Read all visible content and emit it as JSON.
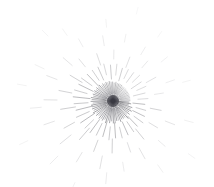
{
  "figure": {
    "type": "radial-streak-field",
    "width": 214,
    "height": 187,
    "background_color": "#ffffff",
    "stroke_color": "#3a3a42",
    "hub": {
      "x": 113,
      "y": 101
    }
  },
  "chart_data": {
    "type": "scatter",
    "xlabel": "",
    "ylabel": "",
    "xlim": [
      0,
      214
    ],
    "ylim": [
      0,
      187
    ],
    "grid": false,
    "legend": null,
    "center": [
      113,
      101
    ],
    "units": "pixels",
    "field_names": [
      "angle",
      "r0",
      "len",
      "w",
      "a"
    ],
    "streaks": [
      [
        4,
        6,
        10,
        0.6,
        0.75
      ],
      [
        9,
        5,
        13,
        0.6,
        0.8
      ],
      [
        14,
        7,
        9,
        0.5,
        0.7
      ],
      [
        19,
        6,
        14,
        0.6,
        0.78
      ],
      [
        24,
        8,
        11,
        0.5,
        0.62
      ],
      [
        29,
        5,
        16,
        0.6,
        0.8
      ],
      [
        34,
        7,
        12,
        0.55,
        0.7
      ],
      [
        39,
        6,
        15,
        0.6,
        0.75
      ],
      [
        44,
        9,
        10,
        0.5,
        0.6
      ],
      [
        49,
        6,
        17,
        0.6,
        0.8
      ],
      [
        54,
        8,
        12,
        0.55,
        0.68
      ],
      [
        59,
        5,
        15,
        0.6,
        0.76
      ],
      [
        64,
        7,
        13,
        0.55,
        0.7
      ],
      [
        69,
        6,
        16,
        0.6,
        0.74
      ],
      [
        74,
        9,
        11,
        0.5,
        0.6
      ],
      [
        79,
        6,
        14,
        0.6,
        0.72
      ],
      [
        84,
        7,
        15,
        0.55,
        0.7
      ],
      [
        89,
        5,
        17,
        0.6,
        0.78
      ],
      [
        94,
        8,
        12,
        0.55,
        0.66
      ],
      [
        99,
        6,
        16,
        0.6,
        0.76
      ],
      [
        104,
        7,
        13,
        0.55,
        0.7
      ],
      [
        109,
        5,
        18,
        0.6,
        0.8
      ],
      [
        114,
        8,
        12,
        0.55,
        0.66
      ],
      [
        119,
        6,
        16,
        0.6,
        0.75
      ],
      [
        124,
        7,
        14,
        0.55,
        0.7
      ],
      [
        129,
        5,
        17,
        0.6,
        0.78
      ],
      [
        134,
        8,
        12,
        0.55,
        0.65
      ],
      [
        139,
        6,
        16,
        0.6,
        0.76
      ],
      [
        144,
        7,
        13,
        0.55,
        0.7
      ],
      [
        149,
        5,
        18,
        0.6,
        0.8
      ],
      [
        154,
        8,
        13,
        0.55,
        0.68
      ],
      [
        159,
        6,
        16,
        0.6,
        0.75
      ],
      [
        164,
        7,
        14,
        0.55,
        0.7
      ],
      [
        169,
        5,
        17,
        0.6,
        0.78
      ],
      [
        174,
        8,
        12,
        0.55,
        0.65
      ],
      [
        179,
        6,
        16,
        0.6,
        0.76
      ],
      [
        184,
        7,
        14,
        0.55,
        0.7
      ],
      [
        189,
        5,
        17,
        0.6,
        0.77
      ],
      [
        194,
        8,
        12,
        0.55,
        0.64
      ],
      [
        199,
        6,
        15,
        0.6,
        0.73
      ],
      [
        204,
        7,
        13,
        0.55,
        0.68
      ],
      [
        209,
        5,
        16,
        0.6,
        0.75
      ],
      [
        214,
        8,
        12,
        0.55,
        0.63
      ],
      [
        219,
        6,
        15,
        0.6,
        0.72
      ],
      [
        224,
        7,
        13,
        0.55,
        0.66
      ],
      [
        229,
        5,
        16,
        0.6,
        0.74
      ],
      [
        234,
        8,
        11,
        0.5,
        0.6
      ],
      [
        239,
        6,
        14,
        0.55,
        0.7
      ],
      [
        244,
        7,
        12,
        0.5,
        0.64
      ],
      [
        249,
        5,
        15,
        0.55,
        0.7
      ],
      [
        254,
        8,
        11,
        0.5,
        0.58
      ],
      [
        259,
        6,
        14,
        0.55,
        0.66
      ],
      [
        264,
        7,
        12,
        0.5,
        0.6
      ],
      [
        269,
        5,
        14,
        0.55,
        0.66
      ],
      [
        274,
        8,
        10,
        0.5,
        0.55
      ],
      [
        279,
        6,
        13,
        0.55,
        0.62
      ],
      [
        284,
        7,
        11,
        0.5,
        0.56
      ],
      [
        289,
        5,
        13,
        0.55,
        0.62
      ],
      [
        294,
        8,
        10,
        0.5,
        0.52
      ],
      [
        299,
        6,
        12,
        0.5,
        0.58
      ],
      [
        304,
        7,
        10,
        0.5,
        0.52
      ],
      [
        309,
        5,
        12,
        0.5,
        0.58
      ],
      [
        314,
        8,
        9,
        0.45,
        0.5
      ],
      [
        319,
        6,
        11,
        0.5,
        0.55
      ],
      [
        324,
        7,
        10,
        0.45,
        0.5
      ],
      [
        329,
        5,
        12,
        0.5,
        0.56
      ],
      [
        334,
        8,
        9,
        0.45,
        0.48
      ],
      [
        339,
        6,
        11,
        0.5,
        0.54
      ],
      [
        344,
        7,
        10,
        0.45,
        0.5
      ],
      [
        349,
        5,
        12,
        0.5,
        0.56
      ],
      [
        354,
        8,
        9,
        0.45,
        0.5
      ],
      [
        359,
        6,
        11,
        0.5,
        0.55
      ],
      [
        6,
        20,
        12,
        0.55,
        0.6
      ],
      [
        16,
        24,
        10,
        0.5,
        0.5
      ],
      [
        26,
        22,
        13,
        0.55,
        0.58
      ],
      [
        36,
        26,
        11,
        0.5,
        0.5
      ],
      [
        46,
        21,
        14,
        0.55,
        0.6
      ],
      [
        56,
        25,
        12,
        0.5,
        0.52
      ],
      [
        66,
        23,
        14,
        0.55,
        0.58
      ],
      [
        76,
        27,
        11,
        0.5,
        0.48
      ],
      [
        86,
        22,
        15,
        0.55,
        0.6
      ],
      [
        96,
        26,
        13,
        0.5,
        0.52
      ],
      [
        106,
        21,
        16,
        0.55,
        0.62
      ],
      [
        116,
        25,
        13,
        0.5,
        0.54
      ],
      [
        126,
        23,
        16,
        0.55,
        0.62
      ],
      [
        136,
        27,
        12,
        0.5,
        0.5
      ],
      [
        146,
        22,
        17,
        0.55,
        0.64
      ],
      [
        156,
        26,
        14,
        0.5,
        0.54
      ],
      [
        166,
        21,
        17,
        0.55,
        0.64
      ],
      [
        176,
        25,
        14,
        0.5,
        0.55
      ],
      [
        186,
        23,
        17,
        0.55,
        0.63
      ],
      [
        196,
        27,
        13,
        0.5,
        0.5
      ],
      [
        206,
        22,
        16,
        0.55,
        0.6
      ],
      [
        216,
        26,
        13,
        0.5,
        0.5
      ],
      [
        226,
        21,
        16,
        0.55,
        0.6
      ],
      [
        236,
        25,
        12,
        0.5,
        0.48
      ],
      [
        246,
        23,
        14,
        0.5,
        0.52
      ],
      [
        256,
        27,
        11,
        0.45,
        0.44
      ],
      [
        266,
        22,
        14,
        0.5,
        0.52
      ],
      [
        276,
        26,
        11,
        0.45,
        0.42
      ],
      [
        286,
        21,
        13,
        0.5,
        0.48
      ],
      [
        296,
        25,
        10,
        0.45,
        0.4
      ],
      [
        306,
        23,
        12,
        0.45,
        0.44
      ],
      [
        316,
        27,
        10,
        0.45,
        0.38
      ],
      [
        326,
        22,
        12,
        0.45,
        0.44
      ],
      [
        336,
        26,
        10,
        0.45,
        0.38
      ],
      [
        346,
        21,
        12,
        0.45,
        0.44
      ],
      [
        356,
        25,
        10,
        0.45,
        0.4
      ],
      [
        11,
        38,
        11,
        0.5,
        0.45
      ],
      [
        31,
        42,
        10,
        0.45,
        0.38
      ],
      [
        51,
        36,
        13,
        0.5,
        0.46
      ],
      [
        71,
        44,
        10,
        0.45,
        0.36
      ],
      [
        91,
        38,
        14,
        0.5,
        0.48
      ],
      [
        111,
        42,
        12,
        0.5,
        0.44
      ],
      [
        131,
        36,
        15,
        0.5,
        0.5
      ],
      [
        151,
        44,
        12,
        0.5,
        0.44
      ],
      [
        171,
        38,
        15,
        0.5,
        0.5
      ],
      [
        191,
        42,
        13,
        0.5,
        0.45
      ],
      [
        211,
        36,
        14,
        0.5,
        0.46
      ],
      [
        231,
        44,
        10,
        0.45,
        0.34
      ],
      [
        251,
        38,
        12,
        0.45,
        0.38
      ],
      [
        271,
        42,
        9,
        0.4,
        0.3
      ],
      [
        291,
        36,
        11,
        0.45,
        0.34
      ],
      [
        311,
        44,
        9,
        0.4,
        0.28
      ],
      [
        331,
        38,
        11,
        0.45,
        0.33
      ],
      [
        351,
        42,
        9,
        0.4,
        0.3
      ],
      [
        21,
        56,
        10,
        0.45,
        0.3
      ],
      [
        41,
        60,
        9,
        0.4,
        0.26
      ],
      [
        61,
        54,
        12,
        0.45,
        0.32
      ],
      [
        81,
        62,
        9,
        0.4,
        0.24
      ],
      [
        101,
        56,
        13,
        0.45,
        0.34
      ],
      [
        121,
        60,
        11,
        0.45,
        0.3
      ],
      [
        141,
        54,
        14,
        0.45,
        0.36
      ],
      [
        161,
        62,
        11,
        0.45,
        0.3
      ],
      [
        181,
        56,
        13,
        0.45,
        0.34
      ],
      [
        201,
        60,
        11,
        0.45,
        0.3
      ],
      [
        221,
        54,
        12,
        0.45,
        0.3
      ],
      [
        241,
        62,
        9,
        0.4,
        0.22
      ],
      [
        261,
        56,
        10,
        0.4,
        0.24
      ],
      [
        281,
        60,
        8,
        0.4,
        0.2
      ],
      [
        301,
        54,
        9,
        0.4,
        0.22
      ],
      [
        321,
        62,
        8,
        0.4,
        0.18
      ],
      [
        341,
        56,
        9,
        0.4,
        0.22
      ],
      [
        15,
        74,
        9,
        0.4,
        0.2
      ],
      [
        55,
        78,
        9,
        0.4,
        0.2
      ],
      [
        95,
        72,
        11,
        0.4,
        0.24
      ],
      [
        135,
        78,
        11,
        0.4,
        0.24
      ],
      [
        175,
        72,
        11,
        0.4,
        0.24
      ],
      [
        205,
        76,
        10,
        0.4,
        0.2
      ],
      [
        235,
        80,
        8,
        0.4,
        0.16
      ],
      [
        265,
        74,
        8,
        0.4,
        0.16
      ],
      [
        305,
        78,
        7,
        0.35,
        0.14
      ],
      [
        345,
        72,
        8,
        0.4,
        0.16
      ],
      [
        35,
        92,
        8,
        0.4,
        0.15
      ],
      [
        115,
        90,
        10,
        0.4,
        0.18
      ],
      [
        155,
        94,
        9,
        0.4,
        0.16
      ],
      [
        190,
        88,
        9,
        0.4,
        0.16
      ],
      [
        225,
        92,
        8,
        0.4,
        0.14
      ],
      [
        285,
        90,
        7,
        0.35,
        0.12
      ]
    ]
  }
}
